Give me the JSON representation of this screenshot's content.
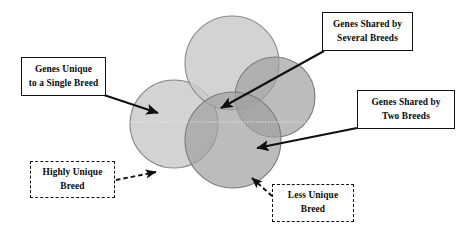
{
  "diagram": {
    "background_color": "#ffffff",
    "circles": [
      {
        "name": "highly-unique-breed-circle",
        "label": "Highly Unique Breed",
        "cx": 174,
        "cy": 124,
        "r": 44,
        "fill": "#c9c9c9",
        "stroke": "#8a8a8a"
      },
      {
        "name": "top-breed-circle",
        "label": "Top Breed",
        "cx": 232,
        "cy": 63,
        "r": 47,
        "fill": "#c9c9c9",
        "stroke": "#8a8a8a"
      },
      {
        "name": "right-breed-circle",
        "label": "Right Breed",
        "cx": 275,
        "cy": 97,
        "r": 40,
        "fill": "#a8a8a8",
        "stroke": "#7a7a7a"
      },
      {
        "name": "less-unique-breed-circle",
        "label": "Less Unique Breed",
        "cx": 233,
        "cy": 140,
        "r": 48,
        "fill": "#a8a8a8",
        "stroke": "#7a7a7a"
      }
    ],
    "callouts": [
      {
        "id": "genes-unique-to-single-breed",
        "lines": [
          "Genes Unique",
          "to a Single Breed"
        ],
        "style": "solid",
        "arrow": {
          "style": "solid",
          "from": [
            104,
            95
          ],
          "to": [
            158,
            113
          ]
        }
      },
      {
        "id": "genes-shared-by-several-breeds",
        "lines": [
          "Genes Shared by",
          "Several Breeds"
        ],
        "style": "solid",
        "arrow": {
          "style": "solid",
          "from": [
            324,
            51
          ],
          "to": [
            221,
            108
          ]
        }
      },
      {
        "id": "genes-shared-by-two-breeds",
        "lines": [
          "Genes Shared by",
          "Two Breeds"
        ],
        "style": "solid",
        "arrow": {
          "style": "solid",
          "from": [
            357,
            128
          ],
          "to": [
            257,
            148
          ]
        }
      },
      {
        "id": "highly-unique-breed",
        "lines": [
          "Highly Unique",
          "Breed"
        ],
        "style": "dashed",
        "arrow": {
          "style": "dashed",
          "from": [
            116,
            180
          ],
          "to": [
            156,
            172
          ]
        }
      },
      {
        "id": "less-unique-breed",
        "lines": [
          "Less Unique",
          "Breed"
        ],
        "style": "dashed",
        "arrow": {
          "style": "dashed",
          "from": [
            272,
            196
          ],
          "to": [
            252,
            178
          ]
        }
      }
    ],
    "colors": {
      "light_circle_fill": "#c9c9c9",
      "dark_circle_fill": "#a8a8a8",
      "circle_stroke": "#8a8a8a",
      "line_color": "#101010",
      "text_color": "#0a0a0a"
    }
  }
}
